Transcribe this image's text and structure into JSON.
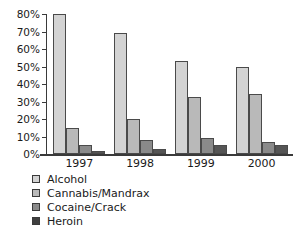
{
  "chart_data": {
    "type": "bar",
    "title": "",
    "xlabel": "",
    "ylabel": "",
    "categories": [
      "1997",
      "1998",
      "1999",
      "2000"
    ],
    "series": [
      {
        "name": "Alcohol",
        "values": [
          80,
          69,
          53,
          50
        ]
      },
      {
        "name": "Cannabis/Mandrax",
        "values": [
          15,
          20,
          32.5,
          34.5
        ]
      },
      {
        "name": "Cocaine/Crack",
        "values": [
          5,
          8,
          9,
          7
        ]
      },
      {
        "name": "Heroin",
        "values": [
          1.5,
          3,
          5,
          5
        ]
      }
    ],
    "ylim": [
      0,
      80
    ],
    "yticks": [
      0,
      10,
      20,
      30,
      40,
      50,
      60,
      70,
      80
    ],
    "ytick_labels": [
      "0%",
      "10%",
      "20%",
      "30%",
      "40%",
      "50%",
      "60%",
      "70%",
      "80%"
    ],
    "grid": false,
    "legend_position": "below-left",
    "colors": {
      "Alcohol": "#d3d3d3",
      "Cannabis/Mandrax": "#b9b9b9",
      "Cocaine/Crack": "#8a8a8a",
      "Heroin": "#3f3f3f"
    }
  }
}
